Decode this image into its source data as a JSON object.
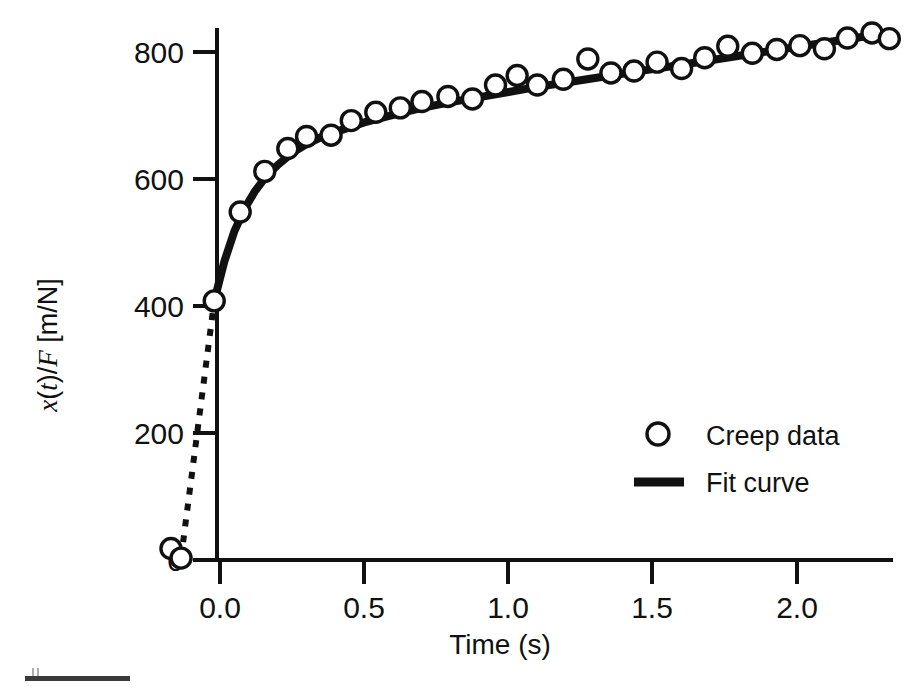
{
  "chart_data": {
    "type": "scatter",
    "title": "",
    "subtitle": "",
    "xlabel": "Time (s)",
    "ylabel": "x(t)/F [m/N]",
    "ylabel_parts": {
      "x_italic": "x",
      "paren_open": "(",
      "t_italic": "t",
      "paren_close": ")",
      "slash": "/",
      "F_italic": "F",
      "unit": " [m/N]"
    },
    "xlim": [
      -0.22,
      2.35
    ],
    "ylim": [
      -30,
      870
    ],
    "xticks": [
      0.0,
      0.5,
      1.0,
      1.5,
      2.0
    ],
    "xticklabels": [
      "0.0",
      "0.5",
      "1.0",
      "1.5",
      "2.0"
    ],
    "yticks": [
      0,
      200,
      400,
      600,
      800
    ],
    "yticklabels": [
      "0",
      "200",
      "400",
      "600",
      "800"
    ],
    "grid": false,
    "legend_position": "center-right",
    "legend": [
      {
        "label": "Creep data",
        "marker": "open-circle",
        "color": "#111111"
      },
      {
        "label": "Fit curve",
        "marker": "line",
        "color": "#111111"
      }
    ],
    "series": [
      {
        "name": "Creep data",
        "marker": "open-circle",
        "color": "#111111",
        "x": [
          -0.17,
          -0.135,
          -0.02,
          0.07,
          0.155,
          0.235,
          0.3,
          0.385,
          0.455,
          0.54,
          0.625,
          0.7,
          0.79,
          0.875,
          0.955,
          1.03,
          1.1,
          1.19,
          1.275,
          1.355,
          1.435,
          1.515,
          1.6,
          1.68,
          1.76,
          1.845,
          1.93,
          2.01,
          2.095,
          2.175,
          2.26,
          2.32
        ],
        "y": [
          18,
          3,
          408,
          548,
          612,
          648,
          667,
          669,
          692,
          705,
          712,
          722,
          730,
          726,
          748,
          763,
          748,
          757,
          789,
          767,
          770,
          784,
          774,
          791,
          809,
          798,
          804,
          810,
          805,
          822,
          830,
          821
        ]
      },
      {
        "name": "Fit curve",
        "marker": "line",
        "color": "#111111",
        "x": [
          -0.02,
          0.015,
          0.05,
          0.085,
          0.12,
          0.16,
          0.2,
          0.25,
          0.3,
          0.36,
          0.42,
          0.5,
          0.6,
          0.7,
          0.8,
          0.9,
          1.0,
          1.1,
          1.2,
          1.3,
          1.4,
          1.5,
          1.6,
          1.7,
          1.8,
          1.9,
          2.0,
          2.1,
          2.2,
          2.32
        ],
        "y": [
          408,
          470,
          518,
          553,
          580,
          604,
          622,
          641,
          655,
          668,
          677,
          689,
          701,
          712,
          721,
          729,
          737,
          745,
          752,
          759,
          766,
          773,
          780,
          787,
          794,
          801,
          808,
          815,
          822,
          830
        ]
      },
      {
        "name": "Loading jump",
        "marker": "dashed-line",
        "color": "#111111",
        "x": [
          -0.135,
          -0.02
        ],
        "y": [
          3,
          408
        ]
      }
    ]
  },
  "footer": {
    "scale_bar": "scale-bar-artifact"
  }
}
